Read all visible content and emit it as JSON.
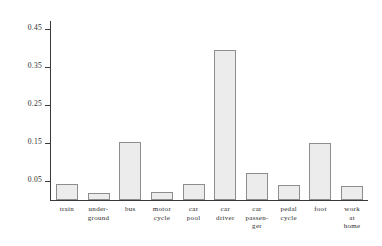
{
  "chart_data": {
    "type": "bar",
    "title": "",
    "subtitle": "",
    "xlabel": "",
    "ylabel": "relative frequency",
    "categories": [
      "train",
      "under-\nground",
      "bus",
      "motor\ncycle",
      "car\npool",
      "car\ndriver",
      "car\npassen-\nger",
      "pedal\ncycle",
      "foot",
      "work\nat\nhome"
    ],
    "values": [
      0.043,
      0.019,
      0.153,
      0.021,
      0.042,
      0.395,
      0.072,
      0.04,
      0.151,
      0.036
    ],
    "ylim": [
      0.0,
      0.47
    ],
    "ytick_values": [
      0.05,
      0.15,
      0.25,
      0.35,
      0.45
    ],
    "ytick_labels": [
      "0.05",
      "0.15",
      "0.25",
      "0.35",
      "0.45"
    ],
    "grid": false,
    "legend": null,
    "bar_color": "#ececec",
    "bar_border_color": "#8d8d8d",
    "axis_color": "#3a3a3a"
  }
}
